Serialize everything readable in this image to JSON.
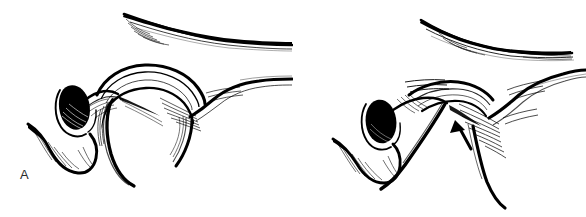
{
  "figure": {
    "domain": "Diagram",
    "kind": "two-panel anatomical line drawing",
    "background_color": "#ffffff",
    "ink_color": "#000000",
    "label_color": "#2b2b2b",
    "width": 586,
    "height": 217,
    "panels": [
      {
        "id": "panel-a",
        "label": "A",
        "label_position": {
          "x": 20,
          "y": 168
        },
        "annotations": [],
        "elements": [
          {
            "name": "superior-curved-bone",
            "description": "thick tapering curved line across upper right, concave downward"
          },
          {
            "name": "hatched-shading-superior",
            "description": "fine parallel hatch strokes at left end of superior curved bone"
          },
          {
            "name": "arch-outline",
            "description": "broad dome-shaped arch in mid-field"
          },
          {
            "name": "dark-foramen-oval",
            "description": "solid black filled oval with hatched lower margin"
          },
          {
            "name": "hook-process-left",
            "description": "downward hooked process at lower left with hatching"
          },
          {
            "name": "descending-limb",
            "description": "long tapering limb descending from arch to lower field"
          },
          {
            "name": "lateral-ramp",
            "description": "line sweeping up and to the right from the arch"
          },
          {
            "name": "hatch-cluster-lateral",
            "description": "fan of short hatch strokes at the lateral junction"
          }
        ]
      },
      {
        "id": "panel-b",
        "label": "B",
        "label_position": {
          "x": 316,
          "y": 170
        },
        "annotations": [
          {
            "name": "pointer-arrow",
            "type": "arrow",
            "points_to": "interrupted cortical margin / defect",
            "direction": "up-left",
            "tip": {
              "x": 163,
              "y": 122
            },
            "tail": {
              "x": 178,
              "y": 148
            }
          }
        ],
        "elements": [
          {
            "name": "superior-curved-bone",
            "description": "thick tapering curved line across upper right, concave downward"
          },
          {
            "name": "hatched-shading-superior",
            "description": "fine parallel hatch strokes along superior curved bone"
          },
          {
            "name": "arch-outline",
            "description": "flattened, displaced arch in mid-field"
          },
          {
            "name": "dark-foramen-oval",
            "description": "solid black filled oval"
          },
          {
            "name": "hook-process-left",
            "description": "downward hooked process at lower left with hatching"
          },
          {
            "name": "descending-limb",
            "description": "long straightened limb descending steeply to lower field"
          },
          {
            "name": "second-descending-limb",
            "description": "additional limb descending to bottom right"
          },
          {
            "name": "lateral-ramp",
            "description": "line sweeping up and to the right"
          },
          {
            "name": "hatch-cluster-lateral",
            "description": "dense fan of hatch strokes at the lateral junction"
          }
        ]
      }
    ]
  }
}
